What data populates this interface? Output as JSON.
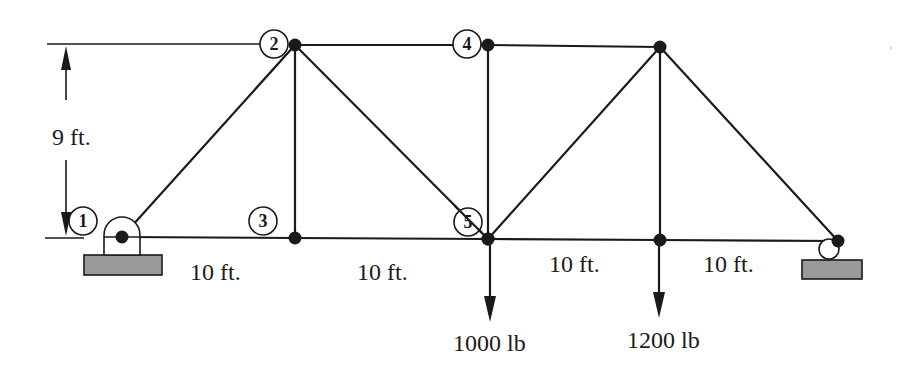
{
  "figure": {
    "type": "truss",
    "height_label": "9 ft.",
    "span_labels": [
      "10 ft.",
      "10 ft.",
      "10 ft.",
      "10 ft."
    ],
    "joint_labels": [
      "1",
      "2",
      "3",
      "4",
      "5"
    ],
    "loads": [
      {
        "joint": "5",
        "label": "1000 lb"
      },
      {
        "joint": "bottom-4",
        "label": "1200 lb"
      }
    ],
    "supports": {
      "left": "pin",
      "right": "roller"
    },
    "colors": {
      "line": "#1a1a1a",
      "support_base": "#9a9a9a",
      "background": "#ffffff"
    }
  }
}
